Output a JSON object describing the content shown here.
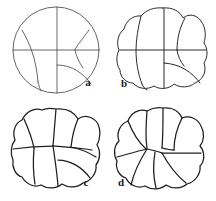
{
  "plate": {
    "title": "Foraminifera test chamber arrangement series",
    "background_color": "#ffffff",
    "line_color": "#2b2b2b",
    "faint_line_color": "#555555",
    "width": 216,
    "height": 201,
    "figures": [
      {
        "id": "a",
        "label": "a",
        "label_x": 88,
        "label_y": 86,
        "outline": "circle",
        "center_x": 56,
        "center_y": 50,
        "radius": 43,
        "description": "Smooth circular outline divided by a vertical and a horizontal line crossing at the centre, with four arcuate chamber walls, one in each quadrant.",
        "chamber_count": 4
      },
      {
        "id": "b",
        "label": "b",
        "label_x": 124,
        "label_y": 87,
        "outline": "lobed",
        "center_x": 163,
        "center_y": 50,
        "radius": 43,
        "lobes": 6,
        "description": "Slightly lobulate outline with vertical and horizontal median lines and curved chamber partitions.",
        "chamber_count": 6
      },
      {
        "id": "c",
        "label": "c",
        "label_x": 86,
        "label_y": 186,
        "outline": "lobed",
        "center_x": 56,
        "center_y": 151,
        "radius": 43,
        "lobes": 7,
        "description": "More strongly lobulate outline; chambers curved and meeting at an off-centre node.",
        "chamber_count": 7
      },
      {
        "id": "d",
        "label": "d",
        "label_x": 121,
        "label_y": 186,
        "outline": "lobed",
        "center_x": 163,
        "center_y": 151,
        "radius": 43,
        "lobes": 8,
        "description": "Deeply lobulate outline; eight inflated chambers radiating from a small central area.",
        "chamber_count": 8
      }
    ]
  }
}
